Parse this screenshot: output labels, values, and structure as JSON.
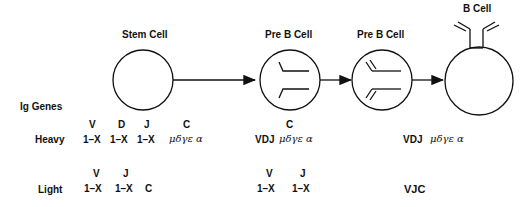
{
  "stages": [
    {
      "label": "Stem Cell"
    },
    {
      "label": "Pre B Cell"
    },
    {
      "label": "Pre B Cell"
    },
    {
      "label": "B Cell"
    }
  ],
  "row_header": "Ig Genes",
  "rows": {
    "heavy": {
      "label": "Heavy",
      "stem": {
        "segments": [
          "V",
          "D",
          "J",
          "C"
        ],
        "values": [
          "1–X",
          "1–X",
          "1–X"
        ],
        "constant": "μδγε α"
      },
      "preb": {
        "segment": "C",
        "joined": "VDJ",
        "constant": "μδγε α"
      },
      "bcell": {
        "joined": "VDJ",
        "constant": "μδγε α"
      }
    },
    "light": {
      "label": "Light",
      "stem": {
        "segments": [
          "V",
          "J"
        ],
        "values": [
          "1–X",
          "1–X"
        ],
        "constant": "C"
      },
      "preb": {
        "segments": [
          "V",
          "J"
        ],
        "values": [
          "1–X",
          "1–X"
        ]
      },
      "bcell": {
        "joined": "VJC"
      }
    }
  }
}
